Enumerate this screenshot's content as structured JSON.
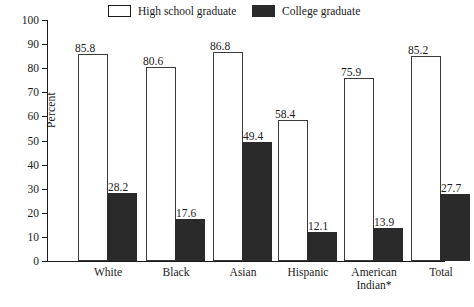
{
  "chart_data": {
    "type": "bar",
    "title": "",
    "xlabel": "",
    "ylabel": "Percent",
    "ylim": [
      0,
      100
    ],
    "ytick_step": 10,
    "yticks": [
      100,
      90,
      80,
      70,
      60,
      50,
      40,
      30,
      20,
      10,
      0
    ],
    "grid": false,
    "legend_position": "top",
    "categories": [
      "White",
      "Black",
      "Asian",
      "Hispanic",
      "American\nIndian*",
      "Total"
    ],
    "series": [
      {
        "name": "High school graduate",
        "color": "#ffffff",
        "values": [
          85.8,
          80.6,
          86.8,
          58.4,
          75.9,
          85.2
        ]
      },
      {
        "name": "College graduate",
        "color": "#2a2a2a",
        "values": [
          28.2,
          17.6,
          49.4,
          12.1,
          13.9,
          27.7
        ]
      }
    ]
  },
  "legend": {
    "entries": [
      {
        "label": "High school graduate",
        "swatch": "light"
      },
      {
        "label": "College graduate",
        "swatch": "dark"
      }
    ]
  },
  "caption": {
    "text": ""
  }
}
